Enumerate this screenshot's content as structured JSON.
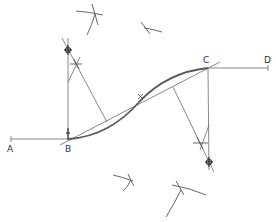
{
  "diagram": {
    "colors": {
      "line": "#6a6a6a",
      "curve": "#5a5a5a",
      "label": "#333333",
      "background": "#ffffff"
    },
    "points": {
      "A": {
        "label": "A",
        "x": 11,
        "y": 139
      },
      "B": {
        "label": "B",
        "x": 69,
        "y": 139
      },
      "C": {
        "label": "C",
        "x": 208,
        "y": 68
      },
      "D": {
        "label": "D",
        "x": 268,
        "y": 68
      },
      "X": {
        "label": "X",
        "x": 140,
        "y": 100
      }
    },
    "centers": {
      "upper": {
        "x": 68,
        "y": 50
      },
      "lower": {
        "x": 209,
        "y": 162
      }
    },
    "labels": {
      "A": "A",
      "B": "B",
      "C": "C",
      "D": "D",
      "X": "X"
    }
  }
}
